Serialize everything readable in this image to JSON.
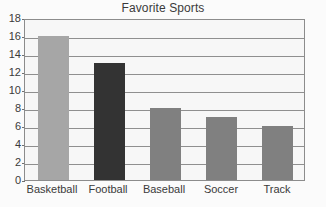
{
  "chart_data": {
    "type": "bar",
    "title": "Favorite Sports",
    "xlabel": "",
    "ylabel": "",
    "categories": [
      "Basketball",
      "Football",
      "Baseball",
      "Soccer",
      "Track"
    ],
    "values": [
      16,
      13,
      8,
      7,
      6
    ],
    "ylim": [
      0,
      18
    ],
    "ytick_labels": [
      "0",
      "2",
      "4",
      "6",
      "8",
      "10",
      "12",
      "14",
      "16",
      "18"
    ],
    "ytick_values": [
      0,
      2,
      4,
      6,
      8,
      10,
      12,
      14,
      16,
      18
    ],
    "grid": true,
    "legend": "none",
    "bar_colors": [
      "#a6a6a6",
      "#333333",
      "#808080",
      "#808080",
      "#808080"
    ],
    "plot_background": "#f7f7f7",
    "axis_color": "#8c8c8c",
    "gridline_color": "#8f8f8f",
    "text_color": "#3a3a3a"
  }
}
